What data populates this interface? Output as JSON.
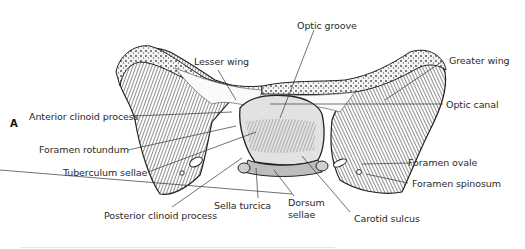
{
  "figure": {
    "panel_letter": "A",
    "labels": {
      "optic_groove": "Optic groove",
      "lesser_wing": "Lesser wing",
      "greater_wing": "Greater wing",
      "anterior_clinoid_process": "Anterior clinoid process",
      "optic_canal": "Optic canal",
      "foramen_rotundum": "Foramen rotundum",
      "tuberculum_sellae": "Tuberculum sellae",
      "foramen_ovale": "Foramen ovale",
      "foramen_spinosum": "Foramen spinosum",
      "sella_turcica": "Sella turcica",
      "dorsum_sellae_1": "Dorsum",
      "dorsum_sellae_2": "sellae",
      "posterior_clinoid_process": "Posterior clinoid process",
      "carotid_sulcus": "Carotid sulcus"
    }
  }
}
